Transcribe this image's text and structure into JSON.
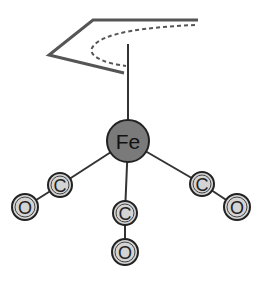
{
  "diagram": {
    "metal": {
      "label": "Fe",
      "cx": 128,
      "cy": 141,
      "r": 21,
      "fill": "#7a7a7a"
    },
    "ligand": {
      "type": "allyl/diene fragment",
      "stroke": "#555555"
    },
    "carbonyls": [
      {
        "carbon": {
          "label": "C",
          "cx": 60,
          "cy": 185
        },
        "oxygen": {
          "label": "O",
          "cx": 25,
          "cy": 207
        }
      },
      {
        "carbon": {
          "label": "C",
          "cx": 125,
          "cy": 213
        },
        "oxygen": {
          "label": "O",
          "cx": 125,
          "cy": 252
        }
      },
      {
        "carbon": {
          "label": "C",
          "cx": 202,
          "cy": 184
        },
        "oxygen": {
          "label": "O",
          "cx": 237,
          "cy": 207
        }
      }
    ],
    "atom_fill": "#d4d4d4",
    "bond_color": "#333333"
  }
}
